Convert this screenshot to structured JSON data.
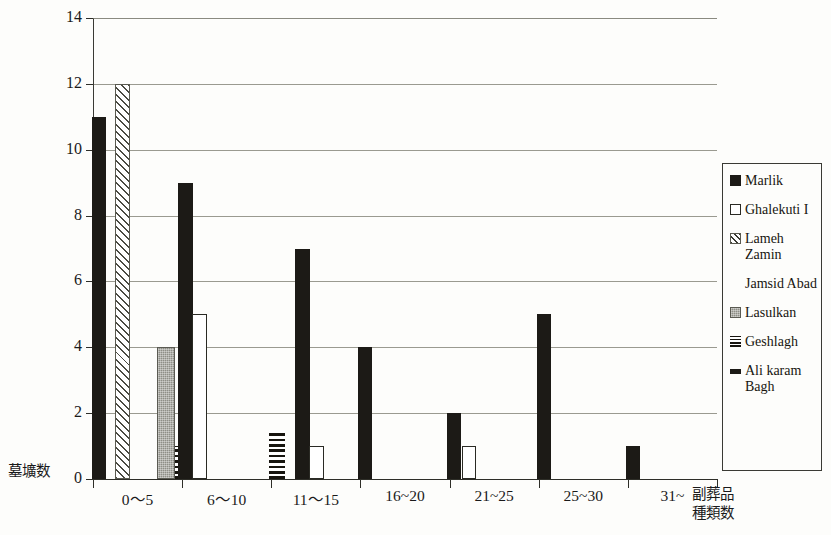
{
  "chart_data": {
    "type": "bar",
    "title": "",
    "subtitle": "",
    "xlabel": "副葬品種類数",
    "ylabel": "墓壙数",
    "ylim": [
      0,
      14
    ],
    "ytick_values": [
      0,
      2,
      4,
      6,
      8,
      10,
      12,
      14
    ],
    "ytick_labels": [
      "0",
      "2",
      "4",
      "6",
      "8",
      "10",
      "12",
      "14"
    ],
    "grid": true,
    "grid_axis": "y",
    "legend_position": "right",
    "categories": [
      "0〜5",
      "6〜10",
      "11〜15",
      "16~20",
      "21~25",
      "25~30",
      "31~"
    ],
    "series": [
      {
        "name": "Marlik",
        "fill": "solid",
        "values": [
          11,
          9,
          7,
          4,
          2,
          5,
          1
        ]
      },
      {
        "name": "Ghalekuti I",
        "fill": "open",
        "values": [
          0,
          5,
          1,
          0,
          1,
          0,
          0
        ]
      },
      {
        "name": "Lameh Zamin",
        "fill": "hatch",
        "values": [
          12,
          0,
          0,
          0,
          0,
          0,
          0
        ]
      },
      {
        "name": "Jamsid Abad",
        "fill": "none",
        "values": [
          0,
          0,
          0,
          0,
          0,
          0,
          0
        ]
      },
      {
        "name": "Lasulkan",
        "fill": "gray",
        "values": [
          4,
          0,
          0,
          0,
          0,
          0,
          0
        ]
      },
      {
        "name": "Geshlagh",
        "fill": "hstripe",
        "values": [
          1,
          0,
          1.5,
          0,
          0,
          0,
          0
        ]
      },
      {
        "name": "Ali karam Bagh",
        "fill": "thick",
        "values": [
          0,
          0,
          0,
          0,
          0,
          0,
          0
        ]
      }
    ]
  },
  "legend": {
    "entries": [
      {
        "label": "Marlik",
        "fill": "solid"
      },
      {
        "label": "Ghalekuti I",
        "fill": "open"
      },
      {
        "label": "Lameh\nZamin",
        "fill": "hatch"
      },
      {
        "label": "Jamsid Abad",
        "fill": "none"
      },
      {
        "label": "Lasulkan",
        "fill": "gray"
      },
      {
        "label": "Geshlagh",
        "fill": "hstripe"
      },
      {
        "label": "Ali karam\nBagh",
        "fill": "thick"
      }
    ]
  },
  "colors": {
    "background": "#fdfdfb",
    "ink": "#1c1a16",
    "grid": "#9a9a90",
    "axis": "#2e2e28",
    "gray_fill": "#8e8e86"
  }
}
